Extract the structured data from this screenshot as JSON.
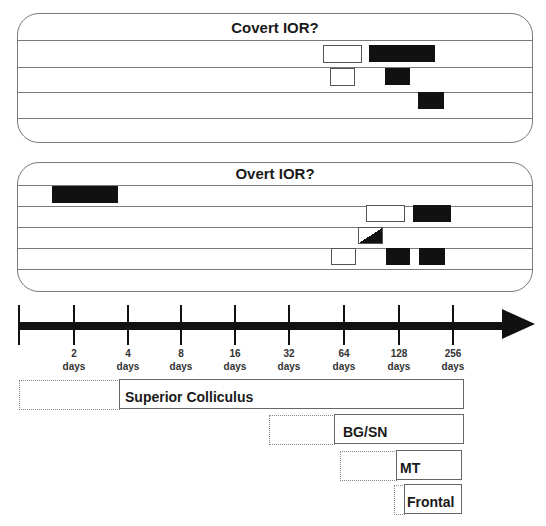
{
  "panels": {
    "covert": {
      "title": "Covert IOR?",
      "rows": [
        {
          "boxes": [
            {
              "type": "white",
              "x": 323,
              "w": 39
            },
            {
              "type": "black",
              "x": 369,
              "w": 66
            }
          ]
        },
        {
          "boxes": [
            {
              "type": "white",
              "x": 330,
              "w": 25
            },
            {
              "type": "black",
              "x": 385,
              "w": 25
            }
          ]
        },
        {
          "boxes": [
            {
              "type": "black",
              "x": 418,
              "w": 26
            }
          ]
        },
        {
          "boxes": []
        }
      ]
    },
    "overt": {
      "title": "Overt IOR?",
      "rows": [
        {
          "boxes": [
            {
              "type": "black",
              "x": 52,
              "w": 66
            }
          ]
        },
        {
          "boxes": [
            {
              "type": "white",
              "x": 366,
              "w": 39
            },
            {
              "type": "black",
              "x": 413,
              "w": 38
            }
          ]
        },
        {
          "boxes": [
            {
              "type": "half",
              "x": 358,
              "w": 25
            }
          ]
        },
        {
          "boxes": [
            {
              "type": "white",
              "x": 331,
              "w": 25
            },
            {
              "type": "black",
              "x": 386,
              "w": 24
            },
            {
              "type": "black",
              "x": 419,
              "w": 26
            }
          ]
        },
        {
          "boxes": []
        }
      ]
    }
  },
  "timeline": {
    "ticks": [
      {
        "value": "",
        "unit": ""
      },
      {
        "value": "2",
        "unit": "days"
      },
      {
        "value": "4",
        "unit": "days"
      },
      {
        "value": "8",
        "unit": "days"
      },
      {
        "value": "16",
        "unit": "days"
      },
      {
        "value": "32",
        "unit": "days"
      },
      {
        "value": "64",
        "unit": "days"
      },
      {
        "value": "128",
        "unit": "days"
      },
      {
        "value": "256",
        "unit": "days"
      }
    ]
  },
  "regions": [
    {
      "label": "Superior Colliculus"
    },
    {
      "label": "BG/SN"
    },
    {
      "label": "MT"
    },
    {
      "label": "Frontal"
    }
  ]
}
